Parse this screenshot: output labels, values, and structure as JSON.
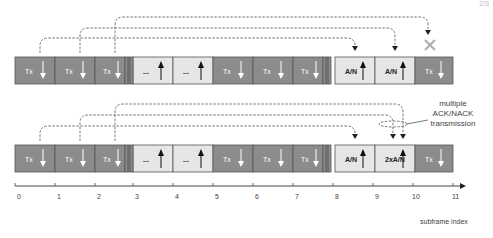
{
  "page_number": "2/3",
  "colors": {
    "tx_fill": "#8c8c8c",
    "ul_fill": "#e6e6e6",
    "border": "#555555",
    "dashed": "#555555",
    "cross": "#b0b0b0",
    "text_dark": "#222222",
    "text_light": "#ffffff"
  },
  "rows": [
    {
      "name": "row-single-ack",
      "y": 57,
      "blocks": [
        {
          "x": 15,
          "w": 40,
          "type": "tx",
          "label": "Tx",
          "arrow": "down"
        },
        {
          "x": 55,
          "w": 40,
          "type": "tx",
          "label": "Tx",
          "arrow": "down"
        },
        {
          "x": 95,
          "w": 30,
          "type": "tx",
          "label": "Tx",
          "arrow": "down"
        },
        {
          "x": 133,
          "w": 40,
          "type": "ul",
          "label": "...",
          "arrow": "up"
        },
        {
          "x": 173,
          "w": 40,
          "type": "ul",
          "label": "...",
          "arrow": "up"
        },
        {
          "x": 213,
          "w": 40,
          "type": "tx",
          "label": "Tx",
          "arrow": "down"
        },
        {
          "x": 253,
          "w": 40,
          "type": "tx",
          "label": "Tx",
          "arrow": "down"
        },
        {
          "x": 293,
          "w": 30,
          "type": "tx",
          "label": "Tx",
          "arrow": "down"
        },
        {
          "x": 335,
          "w": 40,
          "type": "ul",
          "label": "A/N",
          "arrow": "up"
        },
        {
          "x": 375,
          "w": 40,
          "type": "ul",
          "label": "A/N",
          "arrow": "up"
        },
        {
          "x": 415,
          "w": 38,
          "type": "tx",
          "label": "Tx",
          "arrow": "down"
        }
      ],
      "links": [
        {
          "from": 40,
          "to": 355,
          "top": 38
        },
        {
          "from": 80,
          "to": 395,
          "top": 28
        },
        {
          "from": 115,
          "to": 428,
          "top": 17,
          "failed": true
        }
      ]
    },
    {
      "name": "row-multiple-ack",
      "y": 145,
      "blocks": [
        {
          "x": 15,
          "w": 40,
          "type": "tx",
          "label": "Tx",
          "arrow": "down"
        },
        {
          "x": 55,
          "w": 40,
          "type": "tx",
          "label": "Tx",
          "arrow": "down"
        },
        {
          "x": 95,
          "w": 30,
          "type": "tx",
          "label": "Tx",
          "arrow": "down"
        },
        {
          "x": 133,
          "w": 40,
          "type": "ul",
          "label": "...",
          "arrow": "up"
        },
        {
          "x": 173,
          "w": 40,
          "type": "ul",
          "label": "...",
          "arrow": "up"
        },
        {
          "x": 213,
          "w": 40,
          "type": "tx",
          "label": "Tx",
          "arrow": "down"
        },
        {
          "x": 253,
          "w": 40,
          "type": "tx",
          "label": "Tx",
          "arrow": "down"
        },
        {
          "x": 293,
          "w": 30,
          "type": "tx",
          "label": "Tx",
          "arrow": "down"
        },
        {
          "x": 335,
          "w": 40,
          "type": "ul",
          "label": "A/N",
          "arrow": "up"
        },
        {
          "x": 375,
          "w": 40,
          "type": "ul",
          "label": "2xA/N",
          "arrow": "up"
        },
        {
          "x": 415,
          "w": 38,
          "type": "tx",
          "label": "Tx",
          "arrow": "down"
        }
      ],
      "links": [
        {
          "from": 40,
          "to": 355,
          "top": 126
        },
        {
          "from": 80,
          "to": 393,
          "top": 115
        },
        {
          "from": 115,
          "to": 403,
          "top": 104
        }
      ]
    }
  ],
  "separators_x": [
    125,
    323
  ],
  "annotation": {
    "lines": [
      "multiple",
      "ACK/NACK",
      "transmission"
    ]
  },
  "axis": {
    "y": 186,
    "x_start": 15,
    "x_end": 460,
    "ticks": [
      {
        "x": 15,
        "label": "0"
      },
      {
        "x": 55,
        "label": "1"
      },
      {
        "x": 95,
        "label": "2"
      },
      {
        "x": 133,
        "label": "3"
      },
      {
        "x": 173,
        "label": "4"
      },
      {
        "x": 213,
        "label": "5"
      },
      {
        "x": 253,
        "label": "6"
      },
      {
        "x": 293,
        "label": "7"
      },
      {
        "x": 333,
        "label": "8"
      },
      {
        "x": 373,
        "label": "9"
      },
      {
        "x": 413,
        "label": "10"
      },
      {
        "x": 453,
        "label": "11"
      }
    ],
    "title": "subframe index"
  }
}
